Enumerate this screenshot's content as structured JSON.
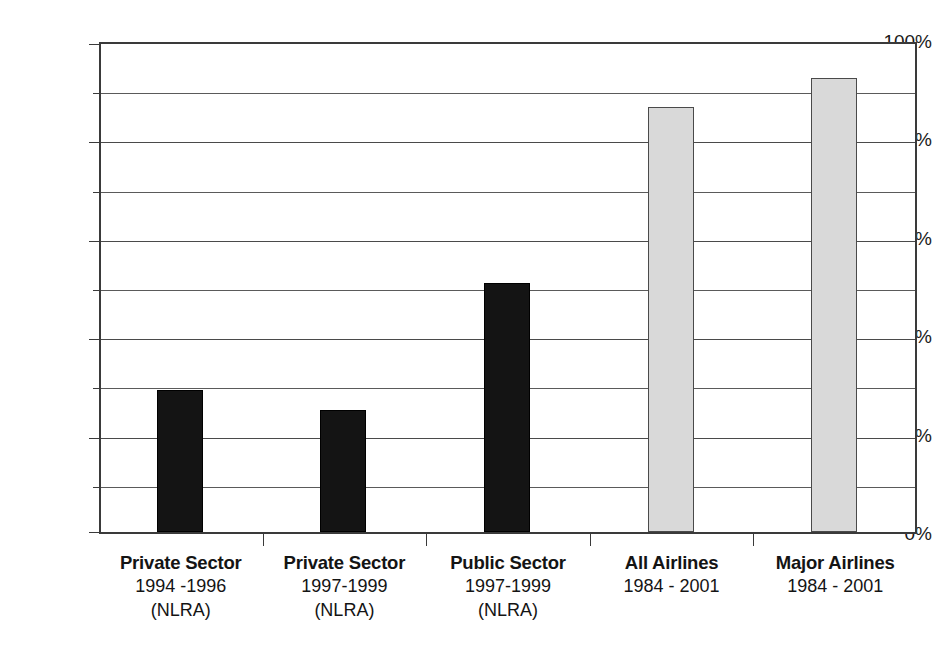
{
  "chart_data": {
    "type": "bar",
    "title": "",
    "subtitle": "",
    "xlabel": "",
    "ylabel": "",
    "ylim": [
      0,
      100
    ],
    "yunit": "%",
    "grid": true,
    "legend": "none",
    "y_ticks_major": [
      "0%",
      "20%",
      "40%",
      "60%",
      "80%",
      "100%"
    ],
    "y_tick_values_major": [
      0,
      20,
      40,
      60,
      80,
      100
    ],
    "y_tick_values_minor": [
      10,
      30,
      50,
      70,
      90
    ],
    "categories": [
      "Private Sector 1994 -1996 (NLRA)",
      "Private Sector 1997-1999 (NLRA)",
      "Public Sector 1997-1999 (NLRA)",
      "All Airlines 1984 - 2001",
      "Major Airlines 1984 - 2001"
    ],
    "values": [
      29,
      25,
      51,
      87,
      93
    ],
    "bars": [
      {
        "line1": "Private Sector",
        "line2": "1994 -1996",
        "line3": "(NLRA)",
        "value": 29,
        "style": "dark",
        "color": "#141414"
      },
      {
        "line1": "Private Sector",
        "line2": "1997-1999",
        "line3": "(NLRA)",
        "value": 25,
        "style": "dark",
        "color": "#141414"
      },
      {
        "line1": "Public Sector",
        "line2": "1997-1999",
        "line3": "(NLRA)",
        "value": 51,
        "style": "dark",
        "color": "#141414"
      },
      {
        "line1": "All Airlines",
        "line2": "1984 - 2001",
        "line3": "",
        "value": 87,
        "style": "light",
        "color": "#d9d9d9"
      },
      {
        "line1": "Major Airlines",
        "line2": "1984 - 2001",
        "line3": "",
        "value": 93,
        "style": "light",
        "color": "#d9d9d9"
      }
    ],
    "colors": {
      "dark_bar": "#141414",
      "light_bar": "#d9d9d9",
      "bar_border": "#4a4a4a",
      "axis": "#3a3a3a",
      "gridline": "#4a4a4a",
      "background": "#ffffff",
      "text": "#141414"
    }
  }
}
